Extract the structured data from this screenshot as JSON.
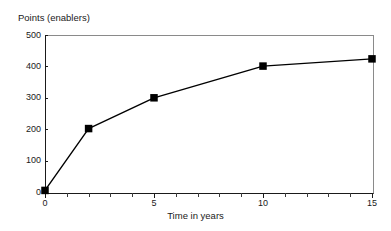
{
  "chart_data": {
    "type": "line",
    "title": "",
    "subtitle": "",
    "xlabel": "Time in years",
    "ylabel": "Points (enablers)",
    "xlim": [
      0,
      15
    ],
    "ylim": [
      0,
      500
    ],
    "grid": false,
    "legend": "none",
    "x": [
      0,
      2,
      5,
      10,
      15
    ],
    "values": [
      5,
      202,
      300,
      401,
      424
    ],
    "series": [
      {
        "name": "Points (enablers)",
        "x": [
          0,
          2,
          5,
          10,
          15
        ],
        "values": [
          5,
          202,
          300,
          401,
          424
        ],
        "marker": "filled-square",
        "color": "#000000"
      }
    ],
    "x_ticks": [
      0,
      5,
      10,
      15
    ],
    "x_tick_labels": [
      "0",
      "5",
      "10",
      "15"
    ],
    "x_minor_ticks": [
      0,
      1,
      2,
      3,
      4,
      5,
      6,
      7,
      8,
      9,
      10,
      11,
      12,
      13,
      14,
      15
    ],
    "y_ticks": [
      0,
      100,
      200,
      300,
      400,
      500
    ],
    "y_tick_labels": [
      "0",
      "100",
      "200",
      "300",
      "400",
      "500"
    ],
    "annotations": []
  },
  "axes": {
    "y_axis_title": "Points (enablers)",
    "x_axis_title": "Time in years"
  },
  "colors": {
    "line": "#000000",
    "marker": "#000000",
    "axis": "#1a1a1a",
    "frame": "#8a8a8a",
    "background": "#ffffff"
  }
}
